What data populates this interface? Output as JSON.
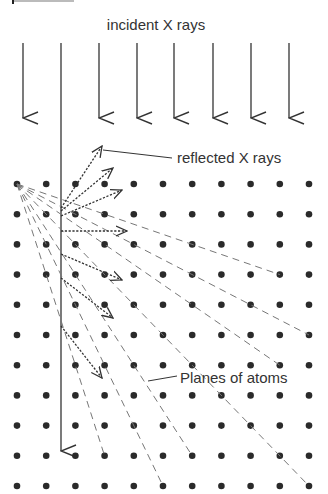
{
  "header_fragment": "p",
  "labels": {
    "incident": "incident X rays",
    "reflected": "reflected X rays",
    "planes": "Planes of atoms"
  },
  "colors": {
    "ink": "#333333",
    "atom": "#2a2a2a",
    "plane": "#777777"
  },
  "lattice": {
    "origin_x": 17,
    "origin_y": 184,
    "dx": 29.2,
    "dy": 30.2,
    "cols": 11,
    "rows": 11
  },
  "incident_rays": {
    "x": [
      23,
      61,
      99,
      137,
      174,
      213,
      251,
      289
    ],
    "top_y": 43,
    "tip_y": 118,
    "long_ray_index": 1,
    "long_ray_tip_y": 451
  },
  "reflected_rays": [
    {
      "x1": 61,
      "y1": 208,
      "x2": 102,
      "y2": 146
    },
    {
      "x1": 61,
      "y1": 211,
      "x2": 113,
      "y2": 168
    },
    {
      "x1": 61,
      "y1": 216,
      "x2": 122,
      "y2": 190
    },
    {
      "x1": 61,
      "y1": 231,
      "x2": 127,
      "y2": 231
    },
    {
      "x1": 61,
      "y1": 254,
      "x2": 122,
      "y2": 280
    },
    {
      "x1": 61,
      "y1": 278,
      "x2": 113,
      "y2": 318
    },
    {
      "x1": 61,
      "y1": 326,
      "x2": 102,
      "y2": 378
    }
  ],
  "planes": [
    {
      "col": 9,
      "row": 3
    },
    {
      "col": 10,
      "row": 5
    },
    {
      "col": 9,
      "row": 6
    },
    {
      "col": 10,
      "row": 10
    },
    {
      "col": 6,
      "row": 9
    },
    {
      "col": 5,
      "row": 10
    },
    {
      "col": 3,
      "row": 9
    }
  ],
  "leaders": {
    "reflected": {
      "x1": 103,
      "y1": 150,
      "x2": 172,
      "y2": 158
    },
    "planes": {
      "x1": 148,
      "y1": 381,
      "x2": 177,
      "y2": 376
    }
  }
}
